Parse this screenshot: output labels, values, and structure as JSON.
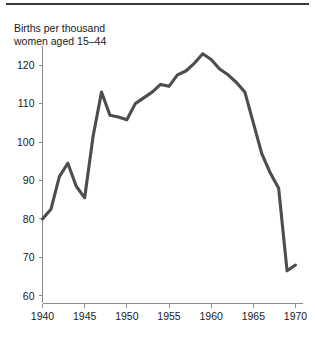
{
  "figure": {
    "title_line_1": "Births per thousand",
    "title_line_2": "women aged 15–44"
  },
  "chart_data": {
    "type": "line",
    "title": "Births per thousand women aged 15–44",
    "xlabel": "",
    "ylabel": "",
    "xlim": [
      1940,
      1970
    ],
    "ylim": [
      58,
      125
    ],
    "grid": false,
    "legend": "none",
    "line_color": "#4d4d4d",
    "axis_color": "#8c8c8c",
    "xticks": [
      1940,
      1945,
      1950,
      1955,
      1960,
      1965,
      1970
    ],
    "xtick_labels": [
      "1940",
      "1945",
      "1950",
      "1955",
      "1960",
      "1965",
      "1970"
    ],
    "yticks": [
      60,
      70,
      80,
      90,
      100,
      110,
      120
    ],
    "ytick_labels": [
      "60",
      "70",
      "80",
      "90",
      "100",
      "110",
      "120"
    ],
    "x": [
      1940,
      1941,
      1942,
      1943,
      1944,
      1945,
      1946,
      1947,
      1948,
      1949,
      1950,
      1951,
      1952,
      1953,
      1954,
      1955,
      1956,
      1957,
      1958,
      1959,
      1960,
      1961,
      1962,
      1963,
      1964,
      1965,
      1966,
      1967,
      1968,
      1969,
      1970
    ],
    "values": [
      80.0,
      82.5,
      91.0,
      94.5,
      88.5,
      85.5,
      101.5,
      113.0,
      107.0,
      106.5,
      105.8,
      110.0,
      111.5,
      113.0,
      115.0,
      114.5,
      117.5,
      118.5,
      120.5,
      123.0,
      121.5,
      119.0,
      117.5,
      115.5,
      113.0,
      105.0,
      97.0,
      92.0,
      88.0,
      66.5,
      68.0
    ]
  }
}
